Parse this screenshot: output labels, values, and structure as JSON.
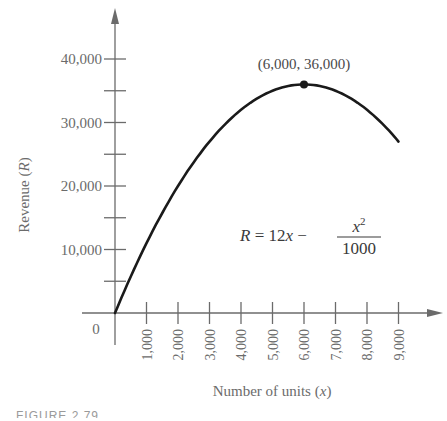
{
  "chart_data": {
    "type": "line",
    "title": "",
    "xlabel": "Number of units (x)",
    "ylabel": "Revenue (R)",
    "xlim": [
      0,
      9000
    ],
    "ylim": [
      0,
      40000
    ],
    "x_ticks": [
      1000,
      2000,
      3000,
      4000,
      5000,
      6000,
      7000,
      8000,
      9000
    ],
    "x_tick_labels": [
      "1,000",
      "2,000",
      "3,000",
      "4,000",
      "5,000",
      "6,000",
      "7,000",
      "8,000",
      "9,000"
    ],
    "y_ticks": [
      10000,
      20000,
      30000,
      40000
    ],
    "y_tick_labels": [
      "10,000",
      "20,000",
      "30,000",
      "40,000"
    ],
    "y_minor_ticks": [
      5000,
      15000,
      25000,
      35000
    ],
    "origin_label": "0",
    "grid": false,
    "legend": null,
    "series": [
      {
        "name": "R = 12x - x^2/1000",
        "x": [
          0,
          1000,
          2000,
          3000,
          4000,
          5000,
          6000,
          7000,
          8000,
          9000
        ],
        "values": [
          0,
          11000,
          20000,
          27000,
          32000,
          35000,
          36000,
          35000,
          32000,
          27000
        ]
      }
    ],
    "annotations": [
      {
        "type": "point",
        "x": 6000,
        "y": 36000,
        "label": "(6,000, 36,000)"
      },
      {
        "type": "formula",
        "text": "R = 12x − x²/1000"
      }
    ]
  },
  "labels": {
    "y_axis_title_main": "Revenue (",
    "y_axis_title_var": "R",
    "y_axis_title_end": ")",
    "x_axis_title_main": "Number of units (",
    "x_axis_title_var": "x",
    "x_axis_title_end": ")",
    "peak_label": "(6,000, 36,000)",
    "origin": "0",
    "formula_lhs": "R",
    "formula_eq": " = 12",
    "formula_x": "x",
    "formula_minus": " −",
    "formula_num": "x",
    "formula_exp": "2",
    "formula_den": "1000",
    "caption": "FIGURE 2.79"
  },
  "colors": {
    "curve": "#1a1a1a",
    "axis": "#6b6b6b",
    "text": "#6b6b6b"
  }
}
